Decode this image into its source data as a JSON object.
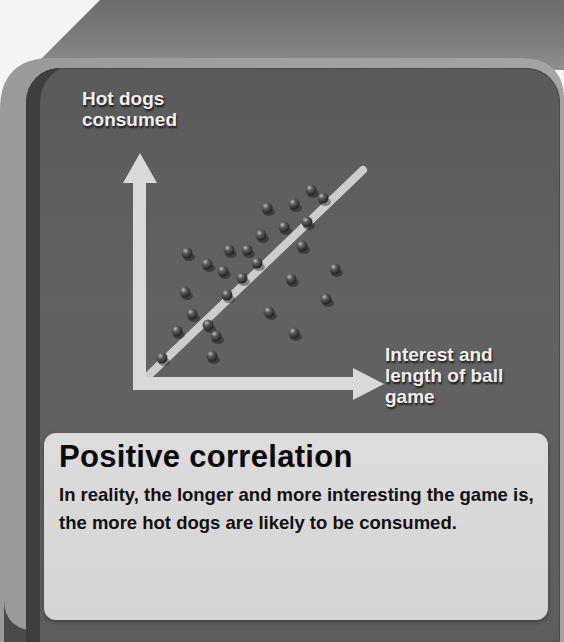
{
  "title": "Positive correlation",
  "description": "In reality, the longer and more interesting the game is, the more hot dogs are likely to be consumed.",
  "axes": {
    "y_label": "Hot dogs consumed",
    "x_label": "Interest and length of ball game"
  },
  "colors": {
    "panel": "#5e5e5e",
    "frame": "#8c8c8c",
    "axis_arrow": "#d8d8d8",
    "trend_line": "#cfcfcf",
    "dot": "#3a3a3a",
    "caption_bg": "#d8d8d8",
    "caption_text": "#0a0a0a"
  },
  "chart_data": {
    "type": "scatter",
    "title": "Positive correlation",
    "xlabel": "Interest and length of ball game",
    "ylabel": "Hot dogs consumed",
    "grid": false,
    "legend": "none",
    "axis_ticks": "none",
    "trend_line": {
      "from": [
        148,
        376
      ],
      "to": [
        363,
        170
      ]
    },
    "points_pixel": [
      [
        311,
        190
      ],
      [
        323,
        198
      ],
      [
        267,
        208
      ],
      [
        294,
        204
      ],
      [
        307,
        222
      ],
      [
        284,
        227
      ],
      [
        261,
        235
      ],
      [
        302,
        246
      ],
      [
        187,
        253
      ],
      [
        229,
        250
      ],
      [
        247,
        250
      ],
      [
        207,
        264
      ],
      [
        257,
        263
      ],
      [
        223,
        271
      ],
      [
        335,
        269
      ],
      [
        242,
        278
      ],
      [
        291,
        279
      ],
      [
        185,
        292
      ],
      [
        227,
        295
      ],
      [
        326,
        299
      ],
      [
        192,
        314
      ],
      [
        269,
        312
      ],
      [
        177,
        331
      ],
      [
        208,
        325
      ],
      [
        216,
        336
      ],
      [
        294,
        333
      ],
      [
        162,
        358
      ],
      [
        212,
        356
      ]
    ]
  }
}
